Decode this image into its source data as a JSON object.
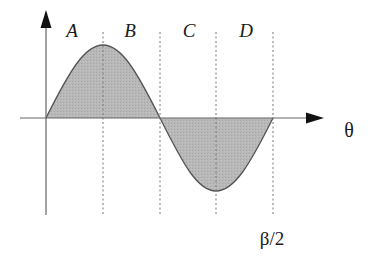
{
  "diagram": {
    "type": "sine-wave-regions",
    "region_labels": [
      "A",
      "B",
      "C",
      "D"
    ],
    "x_axis_label": "θ",
    "tick_label": "β/2",
    "colors": {
      "fill": "#b3b3b3",
      "curve": "#555555",
      "axis": "#666666",
      "dashed": "#777777",
      "arrow": "#111111"
    }
  }
}
